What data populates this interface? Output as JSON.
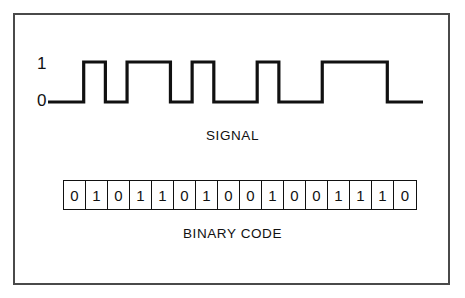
{
  "figure": {
    "signal_caption": "SIGNAL",
    "binary_caption": "BINARY CODE",
    "axis_high_label": "1",
    "axis_low_label": "0",
    "line_color": "#111111",
    "frame_color": "#4a4a4a",
    "background_color": "#ffffff"
  },
  "chart_data": {
    "type": "line",
    "title": "SIGNAL",
    "subtitle": "BINARY CODE",
    "xlabel": "",
    "ylabel": "",
    "ylim": [
      0,
      1
    ],
    "ytick_labels": [
      "0",
      "1"
    ],
    "grid": false,
    "legend": null,
    "waveform_style": "NRZ digital square wave, high = 1, low = 0",
    "bit_count": 16,
    "categories": [
      "1",
      "2",
      "3",
      "4",
      "5",
      "6",
      "7",
      "8",
      "9",
      "10",
      "11",
      "12",
      "13",
      "14",
      "15",
      "16"
    ],
    "values": [
      0,
      1,
      0,
      1,
      1,
      0,
      1,
      0,
      0,
      1,
      0,
      0,
      1,
      1,
      1,
      0
    ],
    "bits": [
      "0",
      "1",
      "0",
      "1",
      "1",
      "0",
      "1",
      "0",
      "0",
      "1",
      "0",
      "0",
      "1",
      "1",
      "1",
      "0"
    ],
    "binary_string": "0101101001001110"
  }
}
